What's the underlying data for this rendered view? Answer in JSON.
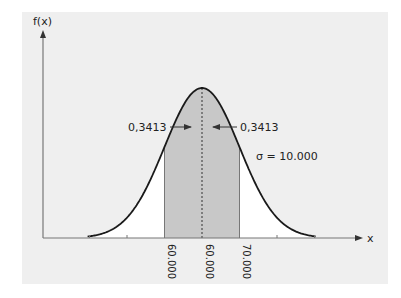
{
  "chart_data": {
    "type": "area",
    "title": "",
    "subtitle": "",
    "xlabel": "x",
    "ylabel": "f(x)",
    "distribution": "normal",
    "mean": 60000,
    "sigma": 10000,
    "sigma_label": "σ = 10.000",
    "x_tick_labels": [
      "60.000",
      "60.000",
      "70.000"
    ],
    "x_tick_values": [
      50000,
      60000,
      70000
    ],
    "shaded_region": {
      "from": 50000,
      "to": 70000,
      "color": "#c8c8c8"
    },
    "annotations": [
      {
        "text": "0,3413",
        "side": "left",
        "arrow": "right"
      },
      {
        "text": "0,3413",
        "side": "right",
        "arrow": "left"
      }
    ],
    "minor_ticks": [
      30000,
      40000,
      80000,
      90000
    ],
    "grid": false,
    "legend": null
  },
  "colors": {
    "background": "#efefef",
    "under_curve": "#ffffff",
    "shade": "#c8c8c8",
    "line": "#1a1a1a",
    "axis": "#777777"
  }
}
